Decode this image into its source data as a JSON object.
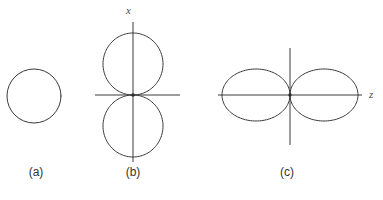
{
  "figure": {
    "width": 383,
    "height": 200,
    "background": "#ffffff",
    "stroke_color": "#3a3a3a",
    "text_color": "#333333"
  },
  "chart_data": {
    "type": "line",
    "title": "",
    "subtitle": "",
    "xlabel": "",
    "ylabel": "",
    "grid": false,
    "legend": "none",
    "panels": [
      {
        "id": "a",
        "caption": "(a)",
        "pattern": "isotropic-circle",
        "axes_drawn": false,
        "axis_labels": [],
        "center": [
          34,
          96
        ],
        "radius": 27,
        "polar": {
          "theta_deg": [
            0,
            30,
            60,
            90,
            120,
            150,
            180,
            210,
            240,
            270,
            300,
            330,
            360
          ],
          "r_normalized": [
            1,
            1,
            1,
            1,
            1,
            1,
            1,
            1,
            1,
            1,
            1,
            1,
            1
          ]
        }
      },
      {
        "id": "b",
        "caption": "(b)",
        "pattern": "figure-eight-vertical",
        "axes_drawn": true,
        "axis_labels": [
          "x"
        ],
        "origin": [
          133,
          95
        ],
        "horizontal_axis_range": [
          92,
          180
        ],
        "vertical_axis_range": [
          22,
          162
        ],
        "lobe_max_radius": 62,
        "lobe_max_width": 30,
        "polar": {
          "theta_deg": [
            0,
            15,
            30,
            45,
            60,
            75,
            90,
            105,
            120,
            135,
            150,
            165,
            180,
            195,
            210,
            225,
            240,
            255,
            270,
            285,
            300,
            315,
            330,
            345,
            360
          ],
          "r_normalized": [
            1.0,
            0.97,
            0.87,
            0.71,
            0.5,
            0.26,
            0.0,
            0.26,
            0.5,
            0.71,
            0.87,
            0.97,
            1.0,
            0.97,
            0.87,
            0.71,
            0.5,
            0.26,
            0.0,
            0.26,
            0.5,
            0.71,
            0.87,
            0.97,
            1.0
          ],
          "note": "r proportional to |cos(theta)| measured from the x axis"
        }
      },
      {
        "id": "c",
        "caption": "(c)",
        "pattern": "figure-eight-horizontal",
        "axes_drawn": true,
        "axis_labels": [
          "z"
        ],
        "origin": [
          290,
          95
        ],
        "horizontal_axis_range": [
          218,
          362
        ],
        "vertical_axis_range": [
          48,
          145
        ],
        "lobe_max_radius": 68,
        "lobe_max_width": 26,
        "polar": {
          "theta_deg": [
            0,
            15,
            30,
            45,
            60,
            75,
            90,
            105,
            120,
            135,
            150,
            165,
            180,
            195,
            210,
            225,
            240,
            255,
            270,
            285,
            300,
            315,
            330,
            345,
            360
          ],
          "r_normalized": [
            1.0,
            0.97,
            0.87,
            0.71,
            0.5,
            0.26,
            0.0,
            0.26,
            0.5,
            0.71,
            0.87,
            0.97,
            1.0,
            0.97,
            0.87,
            0.71,
            0.5,
            0.26,
            0.0,
            0.26,
            0.5,
            0.71,
            0.87,
            0.97,
            1.0
          ],
          "note": "r proportional to |cos(theta)| measured from the z axis"
        }
      }
    ]
  },
  "labels": {
    "axis_x": "x",
    "axis_z": "z",
    "caption_a": "(a)",
    "caption_b": "(b)",
    "caption_c": "(c)"
  }
}
